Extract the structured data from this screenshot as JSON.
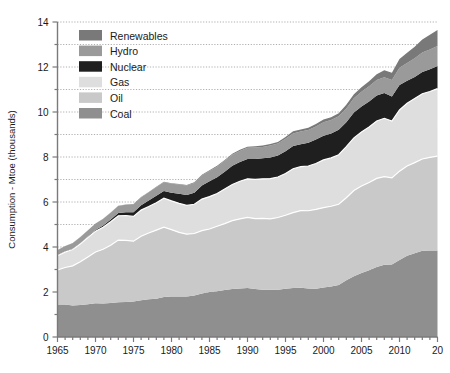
{
  "chart_data": {
    "type": "area",
    "stacked": true,
    "title": "",
    "xlabel": "",
    "ylabel": "Consumption - Mtoe (thousands)",
    "xlim": [
      1965,
      2015
    ],
    "ylim": [
      0,
      14
    ],
    "ytick_step": 2,
    "yminor_step": 1,
    "xtick_step": 5,
    "xminor_step": 1,
    "grid": true,
    "legend_position": "top-left",
    "ytick_labels": [
      "0",
      "2",
      "4",
      "6",
      "8",
      "10",
      "12",
      "14"
    ],
    "ytick_values": [
      0,
      2,
      4,
      6,
      8,
      10,
      12,
      14
    ],
    "xtick_labels": [
      "1965",
      "1970",
      "1975",
      "1980",
      "1985",
      "1990",
      "1995",
      "2000",
      "2005",
      "2010",
      "20"
    ],
    "xtick_values": [
      1965,
      1970,
      1975,
      1980,
      1985,
      1990,
      1995,
      2000,
      2005,
      2010,
      2015
    ],
    "x": [
      1965,
      1966,
      1967,
      1968,
      1969,
      1970,
      1971,
      1972,
      1973,
      1974,
      1975,
      1976,
      1977,
      1978,
      1979,
      1980,
      1981,
      1982,
      1983,
      1984,
      1985,
      1986,
      1987,
      1988,
      1989,
      1990,
      1991,
      1992,
      1993,
      1994,
      1995,
      1996,
      1997,
      1998,
      1999,
      2000,
      2001,
      2002,
      2003,
      2004,
      2005,
      2006,
      2007,
      2008,
      2009,
      2010,
      2011,
      2012,
      2013,
      2014,
      2015
    ],
    "series": [
      {
        "name": "Coal",
        "color": "#8f8f8f",
        "values": [
          1.45,
          1.44,
          1.4,
          1.42,
          1.46,
          1.5,
          1.49,
          1.51,
          1.55,
          1.56,
          1.58,
          1.63,
          1.68,
          1.7,
          1.78,
          1.8,
          1.8,
          1.8,
          1.85,
          1.93,
          2.0,
          2.03,
          2.09,
          2.13,
          2.16,
          2.18,
          2.13,
          2.1,
          2.1,
          2.1,
          2.14,
          2.18,
          2.19,
          2.16,
          2.15,
          2.2,
          2.24,
          2.31,
          2.52,
          2.7,
          2.84,
          2.97,
          3.11,
          3.21,
          3.22,
          3.42,
          3.61,
          3.72,
          3.83,
          3.85,
          3.84
        ]
      },
      {
        "name": "Oil",
        "color": "#c9c9c9",
        "values": [
          1.53,
          1.65,
          1.76,
          1.92,
          2.1,
          2.28,
          2.41,
          2.57,
          2.76,
          2.73,
          2.68,
          2.85,
          2.94,
          3.05,
          3.1,
          2.97,
          2.85,
          2.77,
          2.75,
          2.8,
          2.8,
          2.89,
          2.95,
          3.04,
          3.09,
          3.14,
          3.13,
          3.17,
          3.15,
          3.21,
          3.27,
          3.35,
          3.43,
          3.45,
          3.52,
          3.55,
          3.57,
          3.59,
          3.67,
          3.81,
          3.87,
          3.9,
          3.94,
          3.92,
          3.85,
          3.95,
          3.99,
          4.03,
          4.08,
          4.13,
          4.2
        ]
      },
      {
        "name": "Gas",
        "color": "#dedede",
        "values": [
          0.63,
          0.68,
          0.73,
          0.79,
          0.86,
          0.92,
          0.98,
          1.04,
          1.08,
          1.11,
          1.1,
          1.16,
          1.18,
          1.22,
          1.29,
          1.28,
          1.29,
          1.28,
          1.3,
          1.4,
          1.44,
          1.46,
          1.54,
          1.61,
          1.67,
          1.71,
          1.75,
          1.76,
          1.79,
          1.8,
          1.86,
          1.95,
          1.95,
          1.99,
          2.04,
          2.12,
          2.15,
          2.2,
          2.27,
          2.34,
          2.4,
          2.46,
          2.55,
          2.59,
          2.53,
          2.72,
          2.79,
          2.85,
          2.9,
          2.93,
          3.0
        ]
      },
      {
        "name": "Nuclear",
        "color": "#1f1f1f",
        "values": [
          0.02,
          0.03,
          0.03,
          0.04,
          0.05,
          0.06,
          0.08,
          0.1,
          0.12,
          0.15,
          0.19,
          0.22,
          0.27,
          0.31,
          0.32,
          0.36,
          0.43,
          0.46,
          0.51,
          0.6,
          0.68,
          0.72,
          0.77,
          0.83,
          0.86,
          0.88,
          0.9,
          0.91,
          0.94,
          0.96,
          0.99,
          1.01,
          1.0,
          1.03,
          1.07,
          1.08,
          1.09,
          1.11,
          1.09,
          1.13,
          1.14,
          1.14,
          1.13,
          1.12,
          1.09,
          1.11,
          1.0,
          0.96,
          0.97,
          0.99,
          1.0
        ]
      },
      {
        "name": "Hydro",
        "color": "#9a9a9a",
        "values": [
          0.23,
          0.24,
          0.25,
          0.26,
          0.27,
          0.28,
          0.29,
          0.3,
          0.31,
          0.33,
          0.34,
          0.34,
          0.36,
          0.38,
          0.39,
          0.4,
          0.41,
          0.42,
          0.44,
          0.45,
          0.46,
          0.47,
          0.48,
          0.49,
          0.49,
          0.5,
          0.51,
          0.51,
          0.53,
          0.53,
          0.55,
          0.56,
          0.56,
          0.57,
          0.58,
          0.6,
          0.59,
          0.6,
          0.61,
          0.63,
          0.65,
          0.67,
          0.69,
          0.71,
          0.73,
          0.77,
          0.79,
          0.83,
          0.86,
          0.88,
          0.89
        ]
      },
      {
        "name": "Renewables",
        "color": "#797979",
        "values": [
          0.01,
          0.01,
          0.01,
          0.01,
          0.01,
          0.01,
          0.01,
          0.01,
          0.01,
          0.01,
          0.02,
          0.02,
          0.02,
          0.02,
          0.02,
          0.02,
          0.02,
          0.03,
          0.03,
          0.03,
          0.03,
          0.04,
          0.04,
          0.04,
          0.05,
          0.05,
          0.06,
          0.06,
          0.07,
          0.07,
          0.08,
          0.09,
          0.09,
          0.1,
          0.11,
          0.12,
          0.13,
          0.14,
          0.16,
          0.18,
          0.2,
          0.23,
          0.26,
          0.3,
          0.33,
          0.39,
          0.45,
          0.51,
          0.58,
          0.65,
          0.72
        ]
      }
    ],
    "legend": [
      {
        "label": "Renewables",
        "color": "#797979"
      },
      {
        "label": "Hydro",
        "color": "#9a9a9a"
      },
      {
        "label": "Nuclear",
        "color": "#1f1f1f"
      },
      {
        "label": "Gas",
        "color": "#dedede"
      },
      {
        "label": "Oil",
        "color": "#c9c9c9"
      },
      {
        "label": "Coal",
        "color": "#8f8f8f"
      }
    ],
    "colors": {
      "axis": "#7a7a7a",
      "grid": "#9a9a9a",
      "text": "#1a1a1a",
      "background": "#ffffff"
    }
  }
}
